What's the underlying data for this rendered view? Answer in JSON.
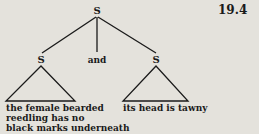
{
  "figure_number": "19.4",
  "tree": {
    "root": {
      "label": "S"
    },
    "children": [
      {
        "label": "S",
        "leaf": [
          "the female bearded",
          "reedling has no",
          "black marks underneath"
        ]
      },
      {
        "label": "and"
      },
      {
        "label": "S",
        "leaf": [
          "its head is tawny"
        ]
      }
    ]
  },
  "colors": {
    "background": "#e4e2dc",
    "ink": "#1a1a1a"
  }
}
